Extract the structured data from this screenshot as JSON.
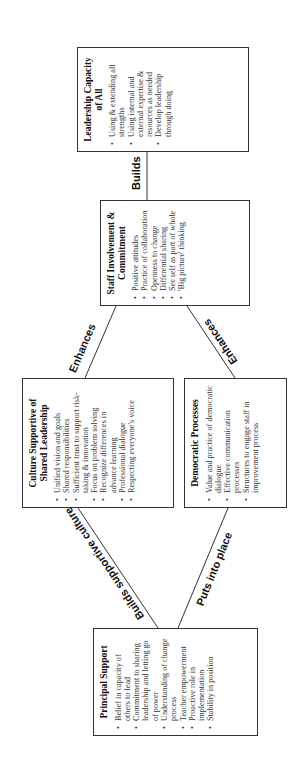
{
  "boxes": {
    "principal": {
      "title": "Principal Support",
      "items": [
        "Belief in capacity of others to lead",
        "Commitment to sharing leadership and letting go of power",
        "Understanding of change process",
        "Teacher empowerment",
        "Proactive role in implementation",
        "Stability in position"
      ]
    },
    "culture": {
      "title": "Culture Supportive of Shared Leadership",
      "items": [
        "Unified vision and goals",
        "Shared responsibilities",
        "Sufficient trust to support risk-taking & innovation",
        "Focus on problem solving",
        "Recognize differences in advance learning",
        "Professional dialogue",
        "Respecting everyone's voice"
      ]
    },
    "democratic": {
      "title": "Democratic Processes",
      "items": [
        "Value and practice of democratic dialogue",
        "Effective communication processes",
        "Structures to engage staff in improvement process"
      ]
    },
    "staff": {
      "title": "Staff Involvement & Commitment",
      "items": [
        "Positive attitudes",
        "Practice of collaboration",
        "Openness to change",
        "Differential sharing",
        "See self as part of whole",
        "'Big picture' thinking"
      ]
    },
    "leadership": {
      "title": "Leadership Capacity of All",
      "items": [
        "Using & extending all strengths",
        "Using internal and external expertise & resources as needed",
        "Develop leadership through doing"
      ]
    }
  },
  "connectors": {
    "builds_supportive_culture": "Builds supportive culture",
    "puts_into_place": "Puts into place",
    "enhances_culture": "Enhances",
    "enhances_democratic": "Enhances",
    "builds": "Builds"
  },
  "colors": {
    "line": "#333333",
    "text": "#222222",
    "background": "#ffffff"
  }
}
